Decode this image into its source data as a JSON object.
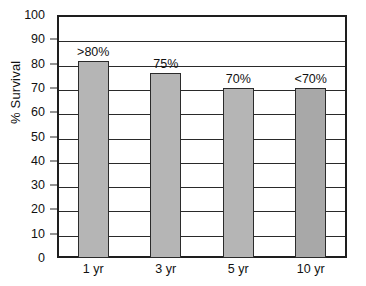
{
  "chart_data": {
    "type": "bar",
    "title": "",
    "xlabel": "",
    "ylabel": "% Survival",
    "ylim": [
      0,
      100
    ],
    "grid": true,
    "legend": "none",
    "categories": [
      "1 yr",
      "3 yr",
      "5 yr",
      "10 yr"
    ],
    "values": [
      81,
      76,
      70,
      70
    ],
    "data_labels": [
      ">80%",
      "75%",
      "70%",
      "<70%"
    ],
    "y_ticks": [
      0,
      10,
      20,
      30,
      40,
      50,
      60,
      70,
      80,
      90,
      100
    ],
    "y_tick_labels": [
      "0",
      "10",
      "20",
      "30",
      "40",
      "50",
      "60",
      "70",
      "80",
      "90",
      "100"
    ],
    "bar_colors": [
      "#b5b5b5",
      "#b5b5b5",
      "#b5b5b5",
      "#a8a8a8"
    ],
    "bar_border_color": "#2b2b2b",
    "axis_color": "#1e1e1e",
    "grid_color": "#2a2a2a",
    "background_color": "#ffffff"
  },
  "axes": {
    "y_title": "% Survival"
  }
}
